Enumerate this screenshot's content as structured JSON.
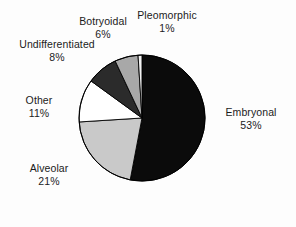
{
  "chart_data": {
    "type": "pie",
    "title": "",
    "subtitle": "",
    "xlabel": "",
    "ylabel": "",
    "grid": false,
    "legend_position": "none",
    "labels_position": "outside",
    "start_angle_deg": 90,
    "direction": "clockwise",
    "unit": "%",
    "categories": [
      "Embryonal",
      "Alveolar",
      "Other",
      "Undifferentiated",
      "Botryoidal",
      "Pleomorphic"
    ],
    "values": [
      53,
      21,
      11,
      8,
      6,
      1
    ],
    "slices": [
      {
        "name": "Embryonal",
        "value": 53,
        "value_text": "53%",
        "color": "#0b0b0b",
        "stroke": "#000000"
      },
      {
        "name": "Alveolar",
        "value": 21,
        "value_text": "21%",
        "color": "#c9c9c9",
        "stroke": "#000000"
      },
      {
        "name": "Other",
        "value": 11,
        "value_text": "11%",
        "color": "#ffffff",
        "stroke": "#000000"
      },
      {
        "name": "Undifferentiated",
        "value": 8,
        "value_text": "8%",
        "color": "#2b2b2b",
        "stroke": "#000000"
      },
      {
        "name": "Botryoidal",
        "value": 6,
        "value_text": "6%",
        "color": "#a8a8a8",
        "stroke": "#000000"
      },
      {
        "name": "Pleomorphic",
        "value": 1,
        "value_text": "1%",
        "color": "#f2f2f2",
        "stroke": "#000000"
      }
    ]
  },
  "labels": {
    "pleomorphic": {
      "name": "Pleomorphic",
      "pct": "1%"
    },
    "botryoidal": {
      "name": "Botryoidal",
      "pct": "6%"
    },
    "undifferentiated": {
      "name": "Undifferentiated",
      "pct": "8%"
    },
    "other": {
      "name": "Other",
      "pct": "11%"
    },
    "alveolar": {
      "name": "Alveolar",
      "pct": "21%"
    },
    "embryonal": {
      "name": "Embryonal",
      "pct": "53%"
    }
  },
  "colors": {
    "background": "#fdfdfd",
    "text": "#1b1b1b",
    "outline": "#000000"
  },
  "geometry": {
    "center_x": 142,
    "center_y": 118,
    "radius": 63
  }
}
